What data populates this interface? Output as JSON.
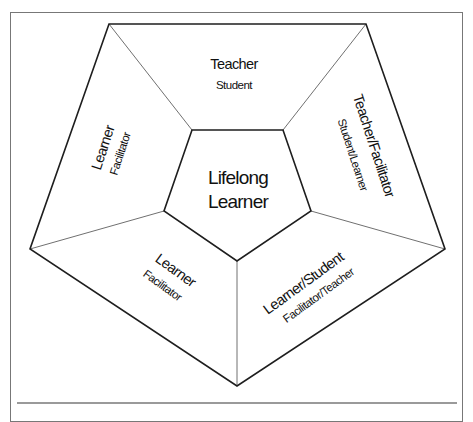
{
  "diagram": {
    "type": "nested-pentagon",
    "center": {
      "line1": "Lifelong",
      "line2": "Learner"
    },
    "panels": {
      "top": {
        "primary": "Teacher",
        "secondary": "Student"
      },
      "right": {
        "primary": "Teacher/Facilitator",
        "secondary": "Student/Learner"
      },
      "bottom_right": {
        "primary": "Learner/Student",
        "secondary": "Facilitator/Teacher"
      },
      "bottom_left": {
        "primary": "Learner",
        "secondary": "Facilitator"
      },
      "left": {
        "primary": "Learner",
        "secondary": "Facilitator"
      }
    },
    "colors": {
      "outline": "#1e1e1e",
      "divider": "#707070",
      "frame": "#777777",
      "text": "#111111",
      "background": "#ffffff"
    }
  }
}
